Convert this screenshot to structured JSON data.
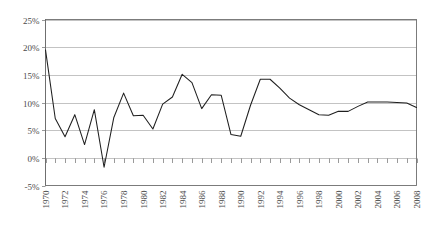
{
  "chart_data": {
    "type": "line",
    "title": "",
    "xlabel": "",
    "ylabel": "",
    "ylim": [
      -5,
      25
    ],
    "ytick_values": [
      25,
      20,
      15,
      10,
      5,
      0,
      -5
    ],
    "ytick_labels": [
      "25%",
      "20%",
      "15%",
      "10%",
      "5%",
      "0%",
      "-5%"
    ],
    "grid": true,
    "legend": "none",
    "xlim": [
      1970,
      2008
    ],
    "xtick_labels": [
      "1970",
      "1972",
      "1974",
      "1976",
      "1978",
      "1980",
      "1982",
      "1984",
      "1986",
      "1988",
      "1990",
      "1992",
      "1994",
      "1996",
      "1998",
      "2000",
      "2002",
      "2004",
      "2006",
      "2008"
    ],
    "xtick_label_rotation": 90,
    "x": [
      1970,
      1971,
      1972,
      1973,
      1974,
      1975,
      1976,
      1977,
      1978,
      1979,
      1980,
      1981,
      1982,
      1983,
      1984,
      1985,
      1986,
      1987,
      1988,
      1989,
      1990,
      1991,
      1992,
      1993,
      1994,
      1995,
      1996,
      1997,
      1998,
      1999,
      2000,
      2001,
      2002,
      2003,
      2004,
      2005,
      2006,
      2007,
      2008
    ],
    "series": [
      {
        "name": "rate",
        "color": "#1f1f1f",
        "values": [
          19.5,
          7.1,
          3.8,
          7.8,
          2.4,
          8.7,
          -1.7,
          7.3,
          11.7,
          7.6,
          7.7,
          5.2,
          9.7,
          11.0,
          15.1,
          13.6,
          8.9,
          11.4,
          11.3,
          4.2,
          3.9,
          9.5,
          14.2,
          14.2,
          12.6,
          10.8,
          9.6,
          8.7,
          7.8,
          7.7,
          8.4,
          8.4,
          9.3,
          10.1,
          10.1,
          10.1,
          10.0,
          9.9,
          9.1
        ]
      }
    ]
  },
  "colors": {
    "series": "#1f1f1f",
    "grid": "#9a9a9a",
    "axis": "#6e6e6e",
    "text": "#4a4a4a",
    "background": "#ffffff"
  }
}
